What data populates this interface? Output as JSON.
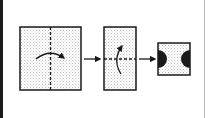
{
  "diagram": {
    "type": "sequence",
    "colors": {
      "stroke": "#1a1a1a",
      "fill_dot": "#bdbdbd",
      "background": "#ffffff"
    },
    "steps": [
      {
        "shape": "square",
        "guide_line": "vertical dashed line",
        "arrow": "curved arrow, left to right"
      },
      {
        "shape": "tall rectangle",
        "guide_line": "horizontal dashed line",
        "arrow": "curved arrow, bottom to top"
      },
      {
        "shape": "small square",
        "markings": "black semicircles on left and right edges"
      }
    ],
    "connectors": [
      {
        "from": 0,
        "to": 1,
        "type": "arrow"
      },
      {
        "from": 1,
        "to": 2,
        "type": "arrow"
      }
    ]
  }
}
